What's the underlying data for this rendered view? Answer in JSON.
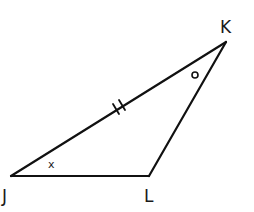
{
  "diagram": {
    "type": "triangle",
    "vertices": [
      {
        "id": "J",
        "label": "J",
        "x": 11,
        "y": 176
      },
      {
        "id": "L",
        "label": "L",
        "x": 149,
        "y": 176
      },
      {
        "id": "K",
        "label": "K",
        "x": 226,
        "y": 42
      }
    ],
    "sides": [
      {
        "id": "JL",
        "from": "J",
        "to": "L"
      },
      {
        "id": "LK",
        "from": "L",
        "to": "K"
      },
      {
        "id": "JK",
        "from": "J",
        "to": "K",
        "congruence_ticks": 2
      }
    ],
    "angle_marks": [
      {
        "vertex": "J",
        "symbol": "x"
      },
      {
        "vertex": "K",
        "symbol": "o"
      }
    ],
    "colors": {
      "stroke": "#111111",
      "background": "#ffffff"
    }
  }
}
